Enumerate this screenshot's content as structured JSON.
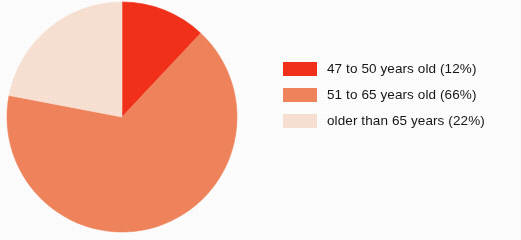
{
  "chart_data": {
    "type": "pie",
    "title": "",
    "subtitle": "",
    "xlabel": "",
    "ylabel": "",
    "legend_position": "right",
    "grid": false,
    "start_angle_deg": 0,
    "direction": "clockwise",
    "categories": [
      "47 to 50 years old",
      "51 to 65 years old",
      "older than 65 years"
    ],
    "values": [
      12,
      66,
      22
    ],
    "value_unit": "percent",
    "colors": [
      "#F4301A",
      "#F2845C",
      "#FAE3D4"
    ],
    "slices": [
      {
        "label": "47 to 50 years old",
        "value": 12,
        "percent_text": "(12%)",
        "legend_text": "47 to 50 years old (12%)",
        "color": "#F4301A",
        "start_deg": 0,
        "end_deg": 43.2
      },
      {
        "label": "51 to 65 years old",
        "value": 66,
        "percent_text": "(66%)",
        "legend_text": "51 to 65 years old (66%)",
        "color": "#F2845C",
        "start_deg": 43.2,
        "end_deg": 280.8
      },
      {
        "label": "older than 65 years",
        "value": 22,
        "percent_text": "(22%)",
        "legend_text": "older than 65 years (22%)",
        "color": "#FAE3D4",
        "start_deg": 280.8,
        "end_deg": 360
      }
    ]
  },
  "legend": {
    "rows": [
      {
        "label": "47 to 50 years old (12%)",
        "color": "#F4301A"
      },
      {
        "label": "51 to 65 years old (66%)",
        "color": "#F2845C"
      },
      {
        "label": "older than 65 years (22%)",
        "color": "#FAE3D4"
      }
    ]
  },
  "geometry": {
    "center_x": 122,
    "center_y": 117,
    "radius": 115
  }
}
